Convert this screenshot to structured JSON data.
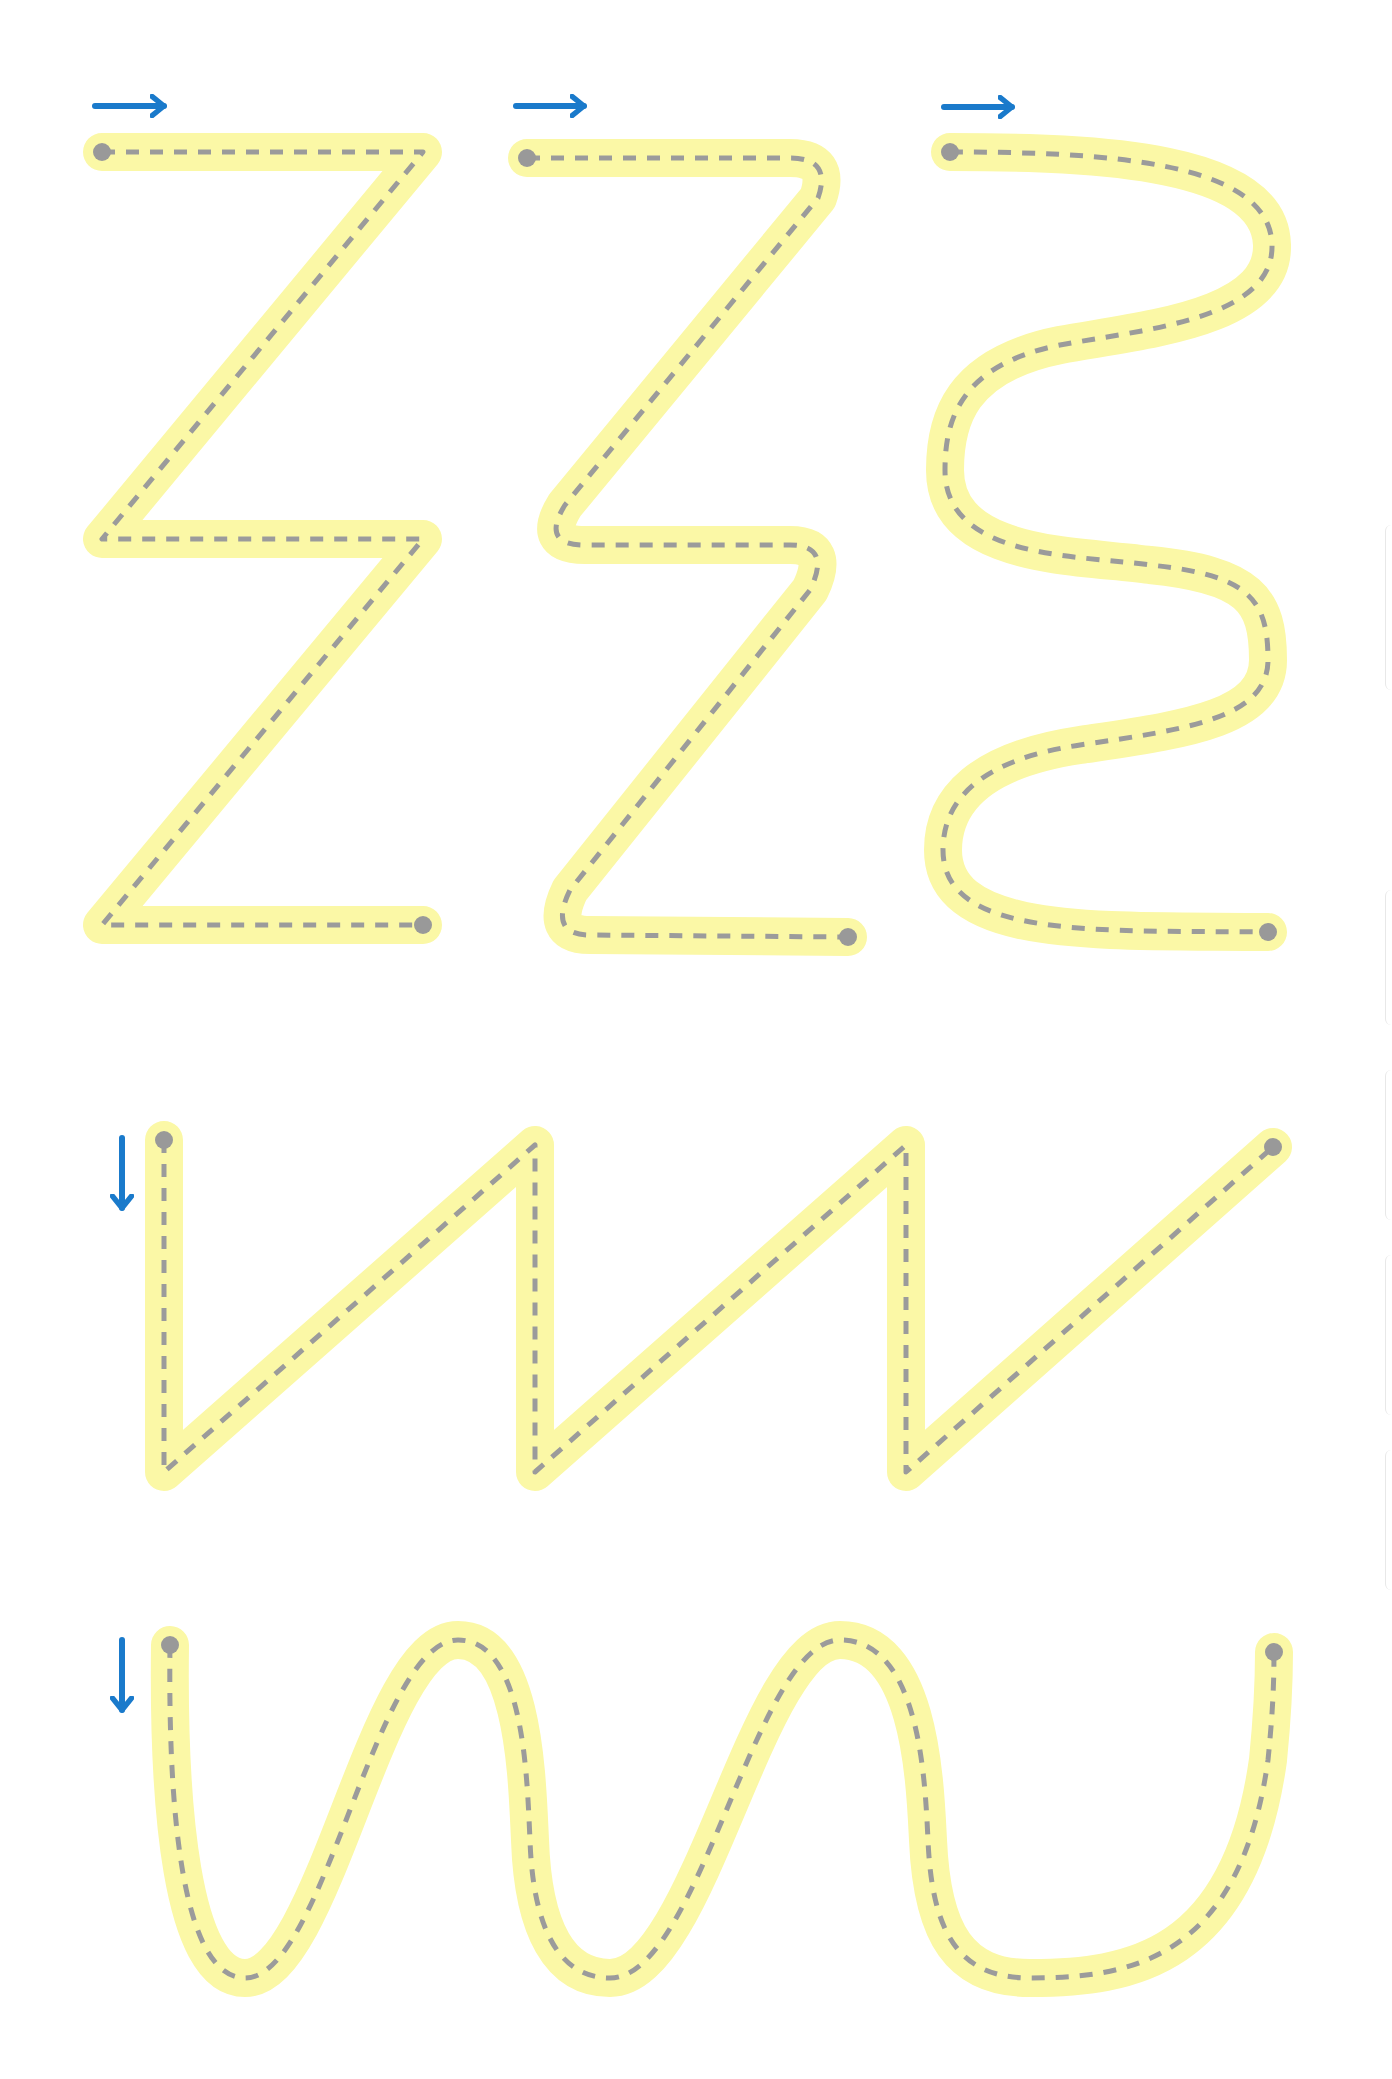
{
  "worksheet": {
    "background": "#ffffff",
    "colors": {
      "track": "#fbf8a6",
      "guide": "#9b9b9b",
      "dot": "#999999",
      "arrow": "#1a7acb"
    },
    "track_width": 38,
    "guide_width": 5,
    "guide_dash": "13 11",
    "dot_radius": 9
  },
  "exercises": [
    {
      "name": "zigzag-sharp",
      "path": "M 102 152 L 423 152 L 102 539 L 423 539 L 102 925 L 423 925",
      "start": [
        102,
        152
      ],
      "end": [
        423,
        925
      ],
      "arrow": {
        "direction": "right",
        "x1": 95,
        "y1": 106,
        "x2": 164,
        "y2": 106
      }
    },
    {
      "name": "zigzag-rounded",
      "path": "M 527 158 L 790 158 Q 832 158 818 198 L 565 505 Q 540 545 585 545 L 790 545 Q 832 545 810 590 L 570 890 Q 548 935 590 935 L 848 937",
      "start": [
        527,
        158
      ],
      "end": [
        848,
        937
      ],
      "arrow": {
        "direction": "right",
        "x1": 516,
        "y1": 106,
        "x2": 584,
        "y2": 106
      }
    },
    {
      "name": "s-wave",
      "path": "M 950 152 C 1100 152 1270 160 1272 245 C 1274 320 1140 330 1060 345 C 960 365 945 420 945 470 C 945 560 1080 555 1150 565 C 1250 575 1268 600 1268 660 C 1268 720 1180 730 1080 745 C 980 760 943 800 943 850 C 943 940 1100 930 1268 932",
      "start": [
        950,
        152
      ],
      "end": [
        1268,
        932
      ],
      "arrow": {
        "direction": "right",
        "x1": 944,
        "y1": 107,
        "x2": 1012,
        "y2": 107
      }
    },
    {
      "name": "sawtooth",
      "path": "M 164 1140 L 164 1472 L 535 1145 L 535 1472 L 906 1145 L 906 1472 L 1273 1147",
      "start": [
        164,
        1140
      ],
      "end": [
        1273,
        1147
      ],
      "arrow": {
        "direction": "down",
        "x1": 122,
        "y1": 1138,
        "x2": 122,
        "y2": 1208
      }
    },
    {
      "name": "u-wave",
      "path": "M 170 1645 C 170 1780 175 1980 245 1980 C 330 1980 380 1640 460 1640 C 520 1640 525 1760 525 1830 C 525 1930 560 1980 610 1980 C 700 1980 760 1640 840 1640 C 920 1640 920 1760 920 1830 C 920 1930 960 1980 1010 1980 C 1095 1980 1100 1780 1100 1650 L 1100 1650",
      "start": [
        170,
        1645
      ],
      "end": [
        1274,
        1652
      ],
      "arrow": {
        "direction": "down",
        "x1": 122,
        "y1": 1640,
        "x2": 122,
        "y2": 1710
      }
    }
  ],
  "side_tabs": [
    {
      "top": 525,
      "height": 165
    },
    {
      "top": 890,
      "height": 135
    },
    {
      "top": 1070,
      "height": 150
    },
    {
      "top": 1255,
      "height": 160
    },
    {
      "top": 1450,
      "height": 140
    }
  ]
}
